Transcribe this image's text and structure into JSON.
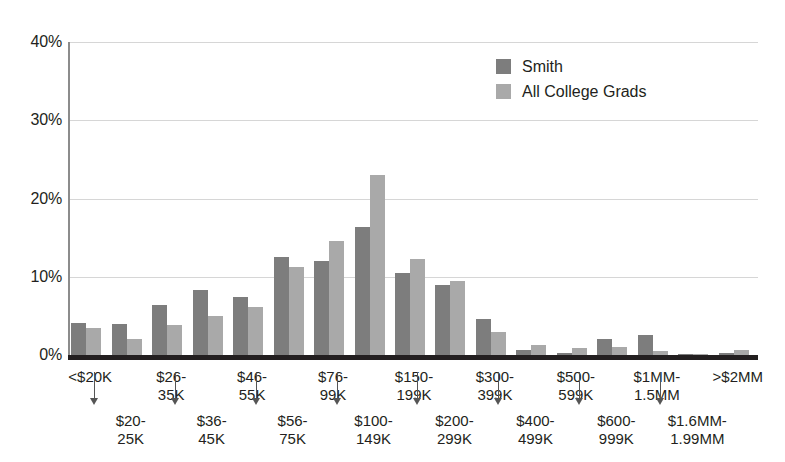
{
  "chart_data": {
    "type": "bar",
    "title": "",
    "subtitle": "",
    "xlabel": "",
    "ylabel": "",
    "ylim": [
      0,
      40
    ],
    "yticks": [
      0,
      10,
      20,
      30,
      40
    ],
    "ytick_labels": [
      "0%",
      "10%",
      "20%",
      "30%",
      "40%"
    ],
    "grid": true,
    "legend_position": "top-right",
    "categories": [
      "<$20K",
      "$20-25K",
      "$26-35K",
      "$36-45K",
      "$46-55K",
      "$56-75K",
      "$76-99K",
      "$100-149K",
      "$150-199K",
      "$200-299K",
      "$300-399K",
      "$400-499K",
      "$500-599K",
      "$600-999K",
      "$1MM-1.5MM",
      "$1.6MM-1.99MM",
      ">$2MM"
    ],
    "series": [
      {
        "name": "Smith",
        "color": "#7d7d7d",
        "values": [
          4.1,
          4.0,
          6.4,
          8.3,
          7.4,
          12.5,
          12.0,
          16.4,
          10.5,
          8.9,
          4.6,
          0.6,
          0.2,
          2.1,
          2.6,
          0.1,
          0.3
        ]
      },
      {
        "name": "All College Grads",
        "color": "#a9a9a9",
        "values": [
          3.4,
          2.0,
          3.8,
          5.0,
          6.1,
          11.3,
          14.6,
          23.0,
          12.3,
          9.5,
          3.0,
          1.3,
          0.9,
          1.0,
          0.5,
          0.1,
          0.6
        ]
      }
    ]
  },
  "legend": {
    "items": [
      {
        "label": "Smith",
        "color": "#7d7d7d"
      },
      {
        "label": "All College Grads",
        "color": "#a9a9a9"
      }
    ]
  },
  "x_axis": {
    "labels": [
      {
        "text": "<$20K",
        "row": "top"
      },
      {
        "text": "$20-\n25K",
        "row": "bottom"
      },
      {
        "text": "$26-\n35K",
        "row": "top"
      },
      {
        "text": "$36-\n45K",
        "row": "bottom"
      },
      {
        "text": "$46-\n55K",
        "row": "top"
      },
      {
        "text": "$56-\n75K",
        "row": "bottom"
      },
      {
        "text": "$76-\n99K",
        "row": "top"
      },
      {
        "text": "$100-\n149K",
        "row": "bottom"
      },
      {
        "text": "$150-\n199K",
        "row": "top"
      },
      {
        "text": "$200-\n299K",
        "row": "bottom"
      },
      {
        "text": "$300-\n399K",
        "row": "top"
      },
      {
        "text": "$400-\n499K",
        "row": "bottom"
      },
      {
        "text": "$500-\n599K",
        "row": "top"
      },
      {
        "text": "$600-\n999K",
        "row": "bottom"
      },
      {
        "text": "$1MM-\n1.5MM",
        "row": "top"
      },
      {
        "text": "$1.6MM-\n1.99MM",
        "row": "bottom"
      },
      {
        "text": ">$2MM",
        "row": "top"
      }
    ]
  },
  "colors": {
    "smith": "#7d7d7d",
    "all_college_grads": "#a9a9a9",
    "axis": "#231f20",
    "gridline": "#d6d6d6",
    "background": "#ffffff"
  }
}
